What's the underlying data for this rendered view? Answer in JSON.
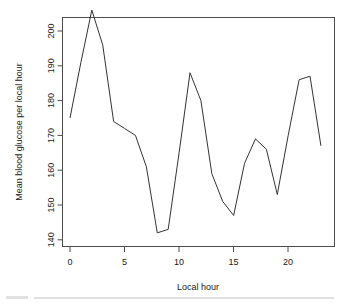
{
  "chart_data": {
    "type": "line",
    "title": "",
    "subtitle": "",
    "xlabel": "Local hour",
    "ylabel": "Mean blood glucose per local hour",
    "x": [
      0,
      1,
      2,
      3,
      4,
      5,
      6,
      7,
      8,
      9,
      10,
      11,
      12,
      13,
      14,
      15,
      16,
      17,
      18,
      19,
      20,
      21,
      22,
      23
    ],
    "values": [
      175,
      191,
      206,
      196,
      174,
      172,
      170,
      161,
      142,
      143,
      165,
      188,
      180,
      159,
      151,
      147,
      162,
      169,
      166,
      153,
      170,
      186,
      187,
      167
    ],
    "series": [
      {
        "name": "Mean blood glucose per local hour",
        "values": [
          175,
          191,
          206,
          196,
          174,
          172,
          170,
          161,
          142,
          143,
          165,
          188,
          180,
          159,
          151,
          147,
          162,
          169,
          166,
          153,
          170,
          186,
          187,
          167
        ]
      }
    ],
    "xlim": [
      -0.5,
      23.5
    ],
    "ylim": [
      140,
      207
    ],
    "xticks": [
      0,
      5,
      10,
      15,
      20
    ],
    "yticks": [
      140,
      150,
      160,
      170,
      180,
      190,
      200
    ],
    "xtick_labels": [
      "0",
      "5",
      "10",
      "15",
      "20"
    ],
    "ytick_labels": [
      "140",
      "150",
      "160",
      "170",
      "180",
      "190",
      "200"
    ],
    "grid": false,
    "legend": null,
    "legend_position": "none",
    "line_color": "#333333",
    "frame_color": "#4d4d4d",
    "background": "#ffffff",
    "annotations": []
  },
  "figure": {
    "ylabel_text": "Mean blood glucose per local hour",
    "xlabel_text": "Local hour"
  }
}
